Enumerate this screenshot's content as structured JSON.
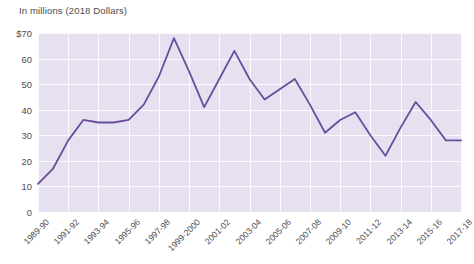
{
  "header": {
    "clipped_title": "",
    "subtitle": "In millions (2018 Dollars)"
  },
  "colors": {
    "line": "#6a4d9c",
    "plot_background": "#e7e0f1",
    "gridline": "#fbfafd",
    "text": "#4d4d52",
    "page_background": "#ffffff"
  },
  "chart_data": {
    "type": "line",
    "title": "",
    "subtitle": "In millions (2018 Dollars)",
    "xlabel": "",
    "ylabel": "In millions (2018 Dollars)",
    "ylim": [
      0,
      70
    ],
    "yticks": [
      0,
      10,
      20,
      30,
      40,
      50,
      60,
      70
    ],
    "ytick_labels": [
      "0",
      "10",
      "20",
      "30",
      "40",
      "50",
      "60",
      "$70"
    ],
    "grid": true,
    "legend": "none",
    "x_tick_labels": [
      "1989-90",
      "1991-92",
      "1993-94",
      "1995-96",
      "1997-98",
      "1999-2000",
      "2001-02",
      "2003-04",
      "2005-06",
      "2007-08",
      "2009-10",
      "2011-12",
      "2013-14",
      "2015-16",
      "2017-18"
    ],
    "x": [
      "1989-90",
      "1990-91",
      "1991-92",
      "1992-93",
      "1993-94",
      "1994-95",
      "1995-96",
      "1996-97",
      "1997-98",
      "1998-99",
      "1999-2000",
      "2000-01",
      "2001-02",
      "2002-03",
      "2003-04",
      "2004-05",
      "2005-06",
      "2006-07",
      "2007-08",
      "2008-09",
      "2009-10",
      "2010-11",
      "2011-12",
      "2012-13",
      "2013-14",
      "2014-15",
      "2015-16",
      "2016-17",
      "2017-18"
    ],
    "values": [
      11,
      17,
      28,
      36,
      35,
      35,
      36,
      42,
      53,
      68,
      55,
      41,
      52,
      63,
      52,
      44,
      48,
      52,
      42,
      31,
      36,
      39,
      30,
      22,
      33,
      43,
      36,
      28,
      28
    ],
    "series": [
      {
        "name": "Amount",
        "values": [
          11,
          17,
          28,
          36,
          35,
          35,
          36,
          42,
          53,
          68,
          55,
          41,
          52,
          63,
          52,
          44,
          48,
          52,
          42,
          31,
          36,
          39,
          30,
          22,
          33,
          43,
          36,
          28,
          28
        ]
      }
    ]
  }
}
